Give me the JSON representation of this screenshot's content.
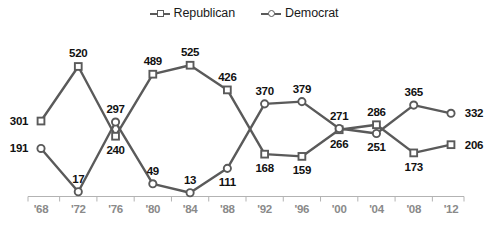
{
  "legend": {
    "position": "top-center",
    "items": [
      {
        "label": "Republican",
        "marker": "square-marker-icon",
        "color": "#5a5a5a"
      },
      {
        "label": "Democrat",
        "marker": "circle-marker-icon",
        "color": "#5a5a5a"
      }
    ]
  },
  "axis": {
    "line_color": "#b3b3b3",
    "tick_color": "#b3b3b3",
    "label_color": "#8a8a8a"
  },
  "colors": {
    "line": "#5a5a5a",
    "marker_fill": "#ffffff",
    "label": "#111111",
    "axis": "#b3b3b3"
  },
  "chart_data": {
    "type": "line",
    "title": "",
    "subtitle": "",
    "xlabel": "",
    "ylabel": "",
    "grid": false,
    "legend_position": "top-center",
    "ylim": [
      0,
      538
    ],
    "categories": [
      "'68",
      "'72",
      "'76",
      "'80",
      "'84",
      "'88",
      "'92",
      "'96",
      "'00",
      "'04",
      "'08",
      "'12"
    ],
    "series": [
      {
        "name": "Republican",
        "marker": "square",
        "color": "#5a5a5a",
        "values": [
          301,
          520,
          240,
          489,
          525,
          426,
          168,
          159,
          266,
          286,
          173,
          206
        ],
        "label_positions": [
          "left",
          "above",
          "below",
          "above",
          "above",
          "above",
          "below",
          "below",
          "below",
          "above",
          "below",
          "right"
        ]
      },
      {
        "name": "Democrat",
        "marker": "circle",
        "color": "#5a5a5a",
        "values": [
          191,
          17,
          297,
          49,
          13,
          111,
          370,
          379,
          271,
          251,
          365,
          332
        ],
        "label_positions": [
          "left",
          "above",
          "above",
          "above",
          "above",
          "below",
          "above",
          "above",
          "above",
          "below",
          "above",
          "right"
        ]
      }
    ]
  }
}
